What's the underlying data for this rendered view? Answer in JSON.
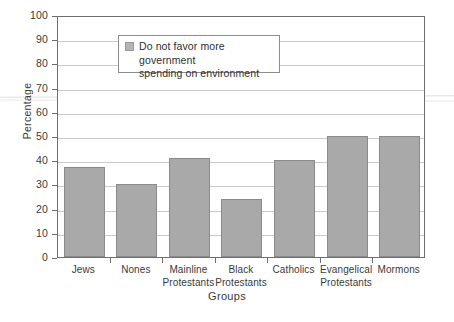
{
  "chart_data": {
    "type": "bar",
    "title": "",
    "xlabel": "Groups",
    "ylabel": "Percentage",
    "ylim": [
      0,
      100
    ],
    "ytick_step": 10,
    "yticks": [
      0,
      10,
      20,
      30,
      40,
      50,
      60,
      70,
      80,
      90,
      100
    ],
    "grid": true,
    "legend_position": "top-left",
    "legend": [
      {
        "name": "Do not favor more government spending on environment",
        "line1": "Do not favor more government",
        "line2": "spending on environment",
        "color": "#b4b4b4"
      }
    ],
    "categories": [
      "Jews",
      "Nones",
      "Mainline Protestants",
      "Black Protestants",
      "Catholics",
      "Evangelical Protestants",
      "Mormons"
    ],
    "category_lines": [
      [
        "Jews"
      ],
      [
        "Nones"
      ],
      [
        "Mainline",
        "Protestants"
      ],
      [
        "Black",
        "Protestants"
      ],
      [
        "Catholics"
      ],
      [
        "Evangelical",
        "Protestants"
      ],
      [
        "Mormons"
      ]
    ],
    "values": [
      37,
      30,
      41,
      24,
      40,
      50,
      50
    ],
    "bar_color": "#a9a9a9",
    "bar_edge_color": "#8a8a8a"
  },
  "caption": {
    "remnant": ""
  }
}
